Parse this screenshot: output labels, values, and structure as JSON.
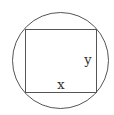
{
  "diagram": {
    "labels": {
      "bottom_side": "x",
      "right_side": "y"
    },
    "colors": {
      "stroke": "#555555",
      "text": "#333333",
      "background": "#ffffff"
    }
  }
}
